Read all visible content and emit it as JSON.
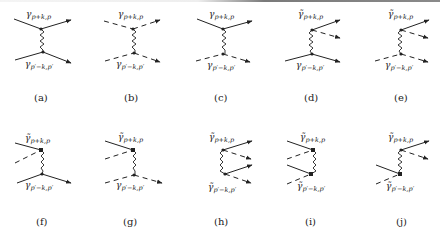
{
  "figure": {
    "panels": [
      {
        "id": "a",
        "caption": "(a)",
        "top_label": "γ",
        "top_sub": "p+k,p",
        "top_bar": false,
        "bottom_label": "γ",
        "bottom_sub": "p′−k,p′",
        "bottom_bar": false,
        "top_in": "solid",
        "top_out": "solid",
        "bottom_in": "solid",
        "bottom_out": "solid"
      },
      {
        "id": "b",
        "caption": "(b)",
        "top_label": "γ",
        "top_sub": "p+k,p",
        "top_bar": false,
        "bottom_label": "γ",
        "bottom_sub": "p′−k,p′",
        "bottom_bar": false,
        "top_in": "dashed",
        "top_out": "dashed",
        "bottom_in": "dashed",
        "bottom_out": "dashed"
      },
      {
        "id": "c",
        "caption": "(c)",
        "top_label": "γ",
        "top_sub": "p+k,p",
        "top_bar": false,
        "bottom_label": "γ",
        "bottom_sub": "p′−k,p′",
        "bottom_bar": false,
        "top_in": "solid",
        "top_out": "solid",
        "bottom_in": "dashed",
        "bottom_out": "dashed"
      },
      {
        "id": "d",
        "caption": "(d)",
        "top_label": "γ̃",
        "top_sub": "p+k,p",
        "top_bar": true,
        "bottom_label": "γ",
        "bottom_sub": "p′−k,p′",
        "bottom_bar": false,
        "top_out": "solid+dashed",
        "bottom_in": "solid",
        "bottom_out": "solid"
      },
      {
        "id": "e",
        "caption": "(e)",
        "top_label": "γ̃",
        "top_sub": "p+k,p",
        "top_bar": true,
        "bottom_label": "γ",
        "bottom_sub": "p′−k,p′",
        "bottom_bar": false,
        "top_out": "solid+dashed",
        "bottom_in": "dashed",
        "bottom_out": "dashed"
      },
      {
        "id": "f",
        "caption": "(f)",
        "top_label": "γ̃",
        "top_sub": "p+k,p",
        "top_bar": true,
        "bottom_label": "γ",
        "bottom_sub": "p′−k,p′",
        "bottom_bar": false,
        "top_in": "solid+dashed",
        "bottom_in": "solid",
        "bottom_out": "solid"
      },
      {
        "id": "g",
        "caption": "(g)",
        "top_label": "γ̃",
        "top_sub": "p+k,p",
        "top_bar": true,
        "bottom_label": "γ",
        "bottom_sub": "p′−k,p′",
        "bottom_bar": false,
        "top_in": "solid+dashed",
        "bottom_in": "dashed",
        "bottom_out": "dashed"
      },
      {
        "id": "h",
        "caption": "(h)",
        "top_label": "γ̃",
        "top_sub": "p+k,p",
        "top_bar": true,
        "bottom_label": "γ̃",
        "bottom_sub": "p′−k,p′",
        "bottom_bar": true,
        "top_out": "solid+dashed",
        "bottom_out": "solid+dashed"
      },
      {
        "id": "i",
        "caption": "(i)",
        "top_label": "γ̃",
        "top_sub": "p+k,p",
        "top_bar": true,
        "bottom_label": "γ̃",
        "bottom_sub": "p′−k,p′",
        "bottom_bar": true,
        "top_in": "solid+dashed",
        "bottom_in": "solid+dashed"
      },
      {
        "id": "j",
        "caption": "(j)",
        "top_label": "γ̃",
        "top_sub": "p+k,p",
        "top_bar": true,
        "bottom_label": "γ̃",
        "bottom_sub": "p′−k,p′",
        "bottom_bar": true,
        "top_out": "solid+dashed",
        "bottom_in": "solid+dashed"
      }
    ]
  }
}
